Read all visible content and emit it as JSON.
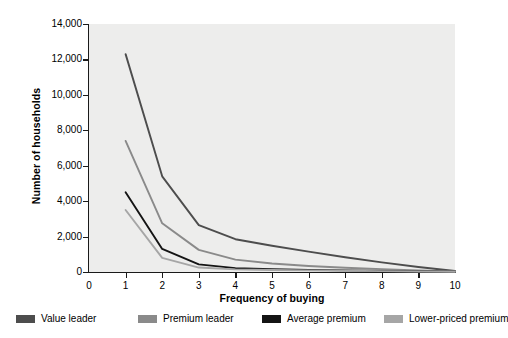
{
  "chart_data": {
    "type": "line",
    "title": "",
    "xlabel": "Frequency of buying",
    "ylabel": "Number of households",
    "xlim": [
      0,
      10
    ],
    "ylim": [
      0,
      14000
    ],
    "x_ticks": [
      "0",
      "1",
      "2",
      "3",
      "4",
      "5",
      "6",
      "7",
      "8",
      "9",
      "10"
    ],
    "y_ticks": [
      "0",
      "2,000",
      "4,000",
      "6,000",
      "8,000",
      "10,000",
      "12,000",
      "14,000"
    ],
    "grid": false,
    "legend_position": "bottom",
    "plot_background": "#ededec",
    "axis_color": "#1a1a1a",
    "x": [
      1,
      2,
      3,
      4,
      5,
      6,
      7,
      8,
      9,
      10
    ],
    "series": [
      {
        "name": "Value leader",
        "color": "#4d4d4d",
        "values": [
          12300,
          5400,
          2650,
          1850,
          1480,
          1150,
          830,
          540,
          280,
          60
        ]
      },
      {
        "name": "Premium leader",
        "color": "#8a8a8a",
        "values": [
          7400,
          2750,
          1250,
          700,
          480,
          340,
          240,
          160,
          90,
          30
        ]
      },
      {
        "name": "Average premium",
        "color": "#141414",
        "values": [
          4500,
          1300,
          430,
          220,
          160,
          120,
          90,
          60,
          40,
          20
        ]
      },
      {
        "name": "Lower-priced premium",
        "color": "#a6a6a6",
        "values": [
          3500,
          800,
          250,
          150,
          110,
          90,
          70,
          50,
          30,
          15
        ]
      }
    ]
  },
  "legend": {
    "items": [
      {
        "label": "Value leader",
        "color": "#4d4d4d"
      },
      {
        "label": "Premium leader",
        "color": "#8a8a8a"
      },
      {
        "label": "Average premium",
        "color": "#141414"
      },
      {
        "label": "Lower-priced premium",
        "color": "#a6a6a6"
      }
    ]
  }
}
